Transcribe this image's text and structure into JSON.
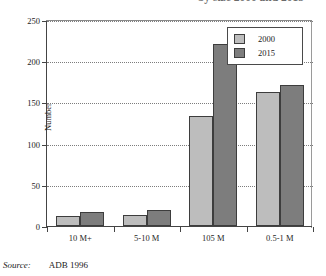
{
  "title": "by size 2000 and 2015",
  "source": {
    "label": "Source:",
    "value": "ADB 1996"
  },
  "axis": {
    "ylabel": "Number",
    "yticks": [
      "0",
      "50",
      "100",
      "150",
      "200",
      "250"
    ]
  },
  "legend": {
    "items": [
      {
        "label": "2000",
        "color": "#bdbdbd"
      },
      {
        "label": "2015",
        "color": "#7d7d7d"
      }
    ]
  },
  "chart_data": {
    "type": "bar",
    "title": "by size 2000 and 2015",
    "xlabel": "",
    "ylabel": "Number",
    "ylim": [
      0,
      250
    ],
    "ytick_step": 50,
    "grid": true,
    "legend_position": "top-right",
    "categories": [
      "10 M+",
      "5-10 M",
      "105 M",
      "0.5-1 M"
    ],
    "series": [
      {
        "name": "2000",
        "color": "#bdbdbd",
        "values": [
          12,
          13,
          133,
          163
        ]
      },
      {
        "name": "2015",
        "color": "#7d7d7d",
        "values": [
          17,
          19,
          221,
          171
        ]
      }
    ],
    "source": "ADB 1996"
  }
}
